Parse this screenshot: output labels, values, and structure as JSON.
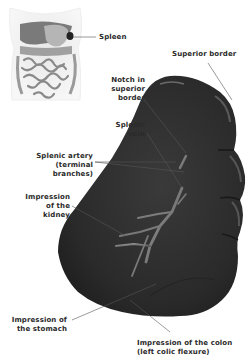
{
  "figure": {
    "inset": {
      "description": "Torso showing abdominal organs with spleen highlighted",
      "label": "Spleen"
    },
    "labels": {
      "spleen": "Spleen",
      "superior_border": "Superior border",
      "notch": [
        "Notch in",
        "superior",
        "border"
      ],
      "splenic_vein": [
        "Splenic",
        "vein"
      ],
      "splenic_artery": [
        "Splenic artery",
        "(terminal",
        "branches)"
      ],
      "kidney": [
        "Impression",
        "of the",
        "kidney"
      ],
      "stomach": [
        "Impression of",
        "the stomach"
      ],
      "colon": [
        "Impression of the colon",
        "(left colic flexure)"
      ]
    },
    "colors": {
      "organ": "#2b2b2b",
      "organ_highlight": "#4a4a4a",
      "leader_line": "#555555",
      "text": "#2a2a2a",
      "background": "#ffffff"
    }
  }
}
